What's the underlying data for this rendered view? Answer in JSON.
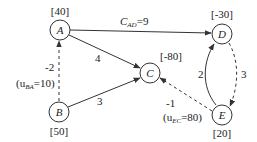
{
  "diagram": {
    "type": "network-flow",
    "colors": {
      "stroke": "#333333",
      "text": "#222222",
      "background": "#ffffff"
    },
    "nodes": [
      {
        "id": "A",
        "label": "A",
        "supply": "[40]",
        "x": 60,
        "y": 30
      },
      {
        "id": "B",
        "label": "B",
        "supply": "[50]",
        "x": 59,
        "y": 112
      },
      {
        "id": "C",
        "label": "C",
        "supply": "[-80]",
        "x": 150,
        "y": 73
      },
      {
        "id": "D",
        "label": "D",
        "supply": "[-30]",
        "x": 222,
        "y": 34
      },
      {
        "id": "E",
        "label": "E",
        "supply": "[20]",
        "x": 222,
        "y": 115
      }
    ],
    "edges": [
      {
        "from": "A",
        "to": "D",
        "label_main": "C",
        "label_sub": "AD",
        "label_tail": "=9",
        "style": "solid"
      },
      {
        "from": "A",
        "to": "C",
        "label": "4",
        "style": "solid"
      },
      {
        "from": "B",
        "to": "C",
        "label": "3",
        "style": "solid"
      },
      {
        "from": "B",
        "to": "A",
        "label": "-2",
        "capacity_pre": "(u",
        "capacity_sub": "BA",
        "capacity_tail": "=10)",
        "style": "dashed"
      },
      {
        "from": "E",
        "to": "C",
        "label": "-1",
        "capacity_pre": "(u",
        "capacity_sub": "EC",
        "capacity_tail": "=80)",
        "style": "dashed"
      },
      {
        "from": "E",
        "to": "D",
        "label": "2",
        "style": "solid"
      },
      {
        "from": "D",
        "to": "E",
        "label": "3",
        "style": "dashed"
      }
    ]
  }
}
